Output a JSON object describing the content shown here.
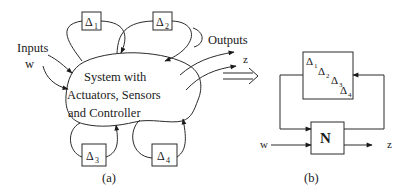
{
  "panel_a": {
    "caption": "(a)",
    "system_block": {
      "line1": "System with",
      "line2": "Actuators, Sensors",
      "line3": "and Controller"
    },
    "inputs_label": "Inputs",
    "input_signal": "w",
    "outputs_label": "Outputs",
    "output_signal": "z",
    "uncertainty_blocks": [
      {
        "symbol": "Δ",
        "sub": "1"
      },
      {
        "symbol": "Δ",
        "sub": "2"
      },
      {
        "symbol": "Δ",
        "sub": "3"
      },
      {
        "symbol": "Δ",
        "sub": "4"
      }
    ]
  },
  "transform_arrow": "⟹",
  "panel_b": {
    "caption": "(b)",
    "plant_block": "N",
    "input_signal": "w",
    "output_signal": "z",
    "delta_block": [
      {
        "symbol": "Δ",
        "sub": "1"
      },
      {
        "symbol": "Δ",
        "sub": "2"
      },
      {
        "symbol": "Δ",
        "sub": "3"
      },
      {
        "symbol": "Δ",
        "sub": "4"
      }
    ]
  }
}
